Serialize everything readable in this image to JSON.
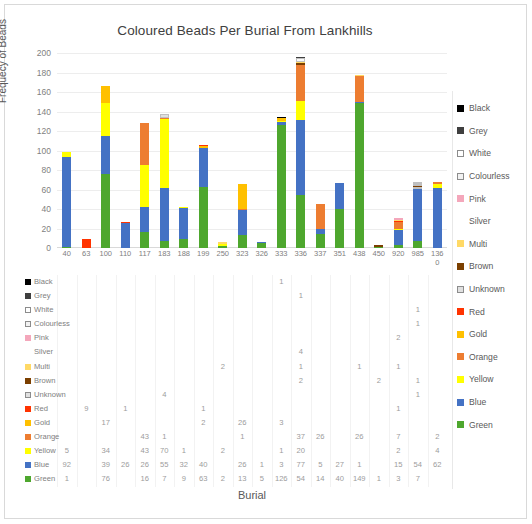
{
  "chart_title": "Coloured Beads Per Burial From Lankhills",
  "axis": {
    "ylabel": "Frequecy of Beads",
    "xlabel": "Burial",
    "yticks": [
      0,
      20,
      40,
      60,
      80,
      100,
      120,
      140,
      160,
      180,
      200
    ],
    "ymax": 200
  },
  "legend_title": "",
  "chart_data": {
    "type": "bar",
    "stacked": true,
    "title": "Coloured Beads Per Burial From Lankhills",
    "xlabel": "Burial",
    "ylabel": "Frequecy of Beads",
    "ylim": [
      0,
      200
    ],
    "grid": true,
    "legend_position": "right",
    "categories": [
      "40",
      "63",
      "100",
      "110",
      "117",
      "183",
      "188",
      "199",
      "250",
      "323",
      "326",
      "333",
      "336",
      "337",
      "351",
      "438",
      "450",
      "920",
      "985",
      "1360"
    ],
    "series": [
      {
        "name": "Black",
        "color": "#000000",
        "values": [
          null,
          null,
          null,
          null,
          null,
          null,
          null,
          null,
          null,
          null,
          null,
          1,
          null,
          null,
          null,
          null,
          null,
          null,
          null,
          null
        ]
      },
      {
        "name": "Grey",
        "color": "#3f3f3f",
        "values": [
          null,
          null,
          null,
          null,
          null,
          null,
          null,
          null,
          null,
          null,
          null,
          null,
          1,
          null,
          null,
          null,
          null,
          null,
          null,
          null
        ]
      },
      {
        "name": "White",
        "color": "#ffffff",
        "values": [
          null,
          null,
          null,
          null,
          null,
          null,
          null,
          null,
          null,
          null,
          null,
          null,
          null,
          null,
          null,
          null,
          null,
          null,
          1,
          null
        ]
      },
      {
        "name": "Colourless",
        "color": "#f2f2f2",
        "values": [
          null,
          null,
          null,
          null,
          null,
          null,
          null,
          null,
          null,
          null,
          null,
          null,
          null,
          null,
          null,
          null,
          null,
          null,
          1,
          null
        ]
      },
      {
        "name": "Pink",
        "color": "#f4a7bb",
        "values": [
          null,
          null,
          null,
          null,
          null,
          null,
          null,
          null,
          null,
          null,
          null,
          null,
          null,
          null,
          null,
          null,
          null,
          2,
          null,
          null
        ]
      },
      {
        "name": "Silver",
        "color": "#fafafa",
        "values": [
          null,
          null,
          null,
          null,
          null,
          null,
          null,
          null,
          null,
          null,
          null,
          null,
          4,
          null,
          null,
          null,
          null,
          null,
          null,
          null
        ]
      },
      {
        "name": "Multi",
        "color": "#ffd966",
        "values": [
          null,
          null,
          null,
          null,
          null,
          null,
          null,
          null,
          2,
          null,
          null,
          null,
          1,
          null,
          null,
          1,
          null,
          1,
          null,
          null
        ]
      },
      {
        "name": "Brown",
        "color": "#7b3f00",
        "values": [
          null,
          null,
          null,
          null,
          null,
          null,
          null,
          null,
          null,
          null,
          null,
          null,
          2,
          null,
          null,
          null,
          2,
          null,
          1,
          null
        ]
      },
      {
        "name": "Unknown",
        "color": "#e0e0e0",
        "values": [
          null,
          null,
          null,
          null,
          null,
          4,
          null,
          null,
          null,
          null,
          null,
          null,
          null,
          null,
          null,
          null,
          null,
          null,
          1,
          null
        ]
      },
      {
        "name": "Red",
        "color": "#ff3300",
        "values": [
          null,
          9,
          null,
          1,
          null,
          null,
          null,
          1,
          null,
          null,
          null,
          null,
          null,
          null,
          null,
          null,
          null,
          1,
          null,
          null
        ]
      },
      {
        "name": "Gold",
        "color": "#ffc000",
        "values": [
          null,
          null,
          17,
          null,
          null,
          null,
          null,
          2,
          null,
          26,
          null,
          3,
          null,
          null,
          null,
          null,
          null,
          null,
          null,
          null
        ]
      },
      {
        "name": "Orange",
        "color": "#ed7d31",
        "values": [
          null,
          null,
          null,
          null,
          43,
          1,
          null,
          null,
          null,
          1,
          null,
          null,
          37,
          26,
          null,
          26,
          null,
          7,
          null,
          2
        ]
      },
      {
        "name": "Yellow",
        "color": "#ffff00",
        "values": [
          5,
          null,
          34,
          null,
          43,
          70,
          1,
          null,
          2,
          null,
          null,
          1,
          20,
          null,
          null,
          null,
          null,
          2,
          null,
          4
        ]
      },
      {
        "name": "Blue",
        "color": "#4472c4",
        "values": [
          92,
          null,
          39,
          26,
          26,
          55,
          32,
          40,
          null,
          26,
          1,
          3,
          77,
          5,
          27,
          1,
          null,
          15,
          54,
          62
        ]
      },
      {
        "name": "Green",
        "color": "#4ea72e",
        "values": [
          1,
          null,
          76,
          null,
          16,
          7,
          9,
          63,
          2,
          13,
          5,
          126,
          54,
          14,
          40,
          149,
          1,
          3,
          7,
          null
        ]
      }
    ]
  },
  "table": {
    "row_labels": [
      "Black",
      "Grey",
      "White",
      "Colourless",
      "Pink",
      "Silver",
      "Multi",
      "Brown",
      "Unknown",
      "Red",
      "Gold",
      "Orange",
      "Yellow",
      "Blue",
      "Green"
    ]
  }
}
